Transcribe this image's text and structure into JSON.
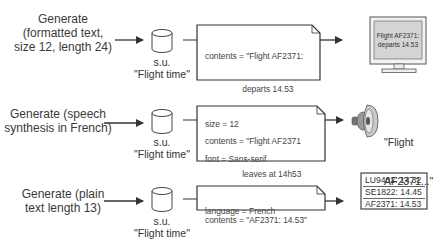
{
  "rows": [
    {
      "label": [
        "Generate",
        "(formatted text,",
        "size 12, length 24)"
      ],
      "store_type": "s.u.",
      "store_name": "\"Flight time\"",
      "note_lines": [
        "contents = \"Flight AF2371:",
        "                departs 14.53",
        "size = 12",
        "font = Sans-serif"
      ],
      "output_type": "monitor",
      "output_text": [
        "Flight AF2371:",
        "departs 14.53"
      ]
    },
    {
      "label": [
        "Generate (speech",
        "synthesis in French)"
      ],
      "store_type": "s.u.",
      "store_name": "\"Flight time\"",
      "note_lines": [
        "contents = \"Flight AF2371",
        "                leaves at 14h53",
        "language = French"
      ],
      "output_type": "speaker",
      "output_text": [
        "\"Flight",
        "AF2371...\""
      ]
    },
    {
      "label": [
        "Generate (plain",
        "text length 13)"
      ],
      "store_type": "s.u.",
      "store_name": "\"Flight time\"",
      "note_lines": [
        "contents = \"AF2371: 14.53\""
      ],
      "output_type": "list-display",
      "output_text": [
        "LU9402: 14.32",
        "SE1822: 14.45",
        "AF2371: 14.53"
      ]
    }
  ],
  "colors": {
    "stroke": "#333333",
    "screen_fill": "#d6d6d6",
    "monitor_frame": "#f2f2f2",
    "speaker_fill": "#b8b8b8"
  }
}
